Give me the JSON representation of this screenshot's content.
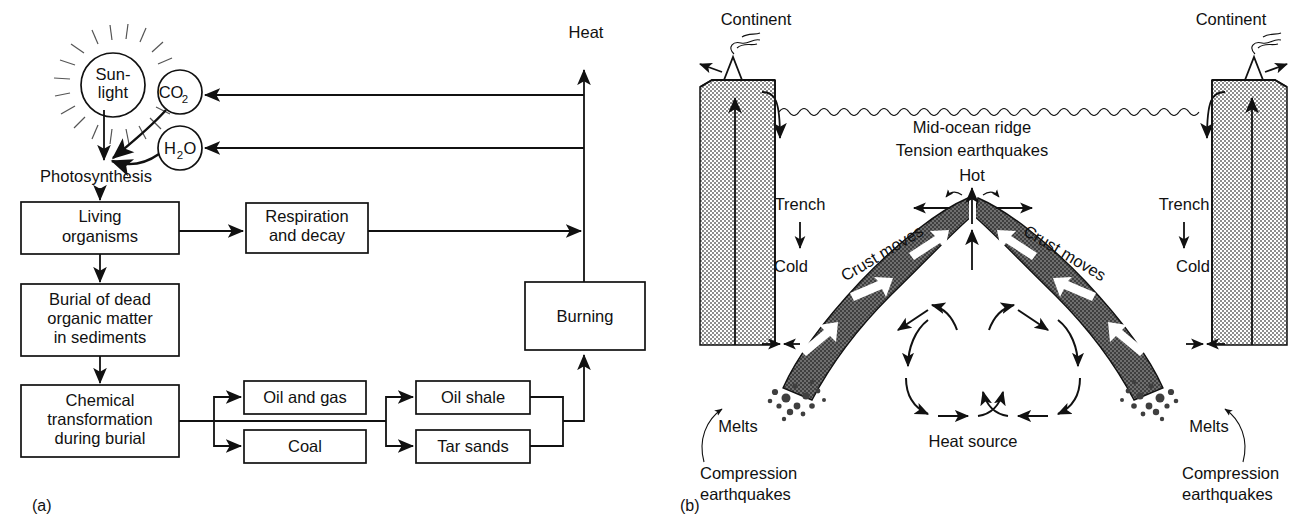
{
  "figure": {
    "panel_a": {
      "label": "(a)",
      "title_flow": "Carbon cycle / fossil fuel formation flow chart",
      "sun": {
        "line1": "Sun-",
        "line2": "light",
        "icon": "sun-icon"
      },
      "molecules": [
        {
          "name": "co2-node",
          "main": "CO",
          "sub": "2"
        },
        {
          "name": "h2o-node",
          "main": "H",
          "sub": "2",
          "tail": "O"
        }
      ],
      "photosynthesis_label": "Photosynthesis",
      "heat_label": "Heat",
      "boxes": [
        {
          "id": "living-organisms",
          "lines": [
            "Living",
            "organisms"
          ]
        },
        {
          "id": "respiration-decay",
          "lines": [
            "Respiration",
            "and decay"
          ]
        },
        {
          "id": "burial",
          "lines": [
            "Burial of dead",
            "organic matter",
            "in sediments"
          ]
        },
        {
          "id": "chemical-transformation",
          "lines": [
            "Chemical",
            "transformation",
            "during burial"
          ]
        },
        {
          "id": "oil-and-gas",
          "lines": [
            "Oil and gas"
          ]
        },
        {
          "id": "coal",
          "lines": [
            "Coal"
          ]
        },
        {
          "id": "oil-shale",
          "lines": [
            "Oil shale"
          ]
        },
        {
          "id": "tar-sands",
          "lines": [
            "Tar sands"
          ]
        },
        {
          "id": "burning",
          "lines": [
            "Burning"
          ]
        }
      ]
    },
    "panel_b": {
      "label": "(b)",
      "title_flow": "Sea-floor spreading and subduction cross-section",
      "continent_left": "Continent",
      "continent_right": "Continent",
      "ridge_label": "Mid-ocean ridge",
      "tension_label": "Tension earthquakes",
      "hot_label": "Hot",
      "heat_source_label": "Heat source",
      "trench_left": "Trench",
      "trench_right": "Trench",
      "cold_left": "Cold",
      "cold_right": "Cold",
      "crust_moves_left": "Crust moves",
      "crust_moves_right": "Crust moves",
      "melts_left": "Melts",
      "melts_right": "Melts",
      "compression_left": [
        "Compression",
        "earthquakes"
      ],
      "compression_right": [
        "Compression",
        "earthquakes"
      ]
    },
    "colors": {
      "ink": "#111111",
      "paper": "#ffffff",
      "slab_fill": "#4a4a4a",
      "continent_fill": "#9a9a9a"
    }
  }
}
